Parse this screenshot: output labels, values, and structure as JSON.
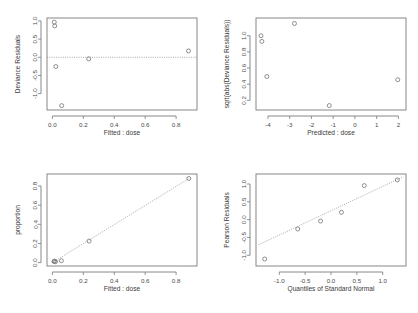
{
  "figure": {
    "title": "",
    "layout": "2x2 grid of regression diagnostic plots",
    "background_color": "#ffffff",
    "point_color": "#6b6b6b",
    "axis_color": "#7a7a7a",
    "reference_line_color": "#9a9a9a",
    "point_symbol": "open-circle"
  },
  "chart_data": [
    {
      "id": "residuals-vs-fitted",
      "position": "top-left",
      "type": "scatter",
      "title": "",
      "xlabel": "Fitted : dose",
      "ylabel": "Deviance Residuals",
      "xlim": [
        -0.035,
        0.935
      ],
      "ylim": [
        -1.45,
        1.08
      ],
      "xticks": [
        0.0,
        0.2,
        0.4,
        0.6,
        0.8
      ],
      "xticklabels": [
        "0.0",
        "0.2",
        "0.4",
        "0.6",
        "0.8"
      ],
      "yticks": [
        -1.0,
        -0.5,
        0.0,
        0.5,
        1.0
      ],
      "yticklabels": [
        "-1.0",
        "-0.5",
        "0.0",
        "0.5",
        "1.0"
      ],
      "grid": false,
      "legend": null,
      "x": [
        0.012,
        0.015,
        0.022,
        0.06,
        0.235,
        0.88
      ],
      "y": [
        0.965,
        0.862,
        -0.255,
        -1.33,
        -0.042,
        0.175
      ],
      "reference_line": {
        "type": "horizontal-dotted",
        "y": 0.0,
        "style": "dotted"
      }
    },
    {
      "id": "scale-location",
      "position": "top-right",
      "type": "scatter",
      "title": "",
      "xlabel": "Predicted : dose",
      "ylabel": "sqrt(abs(Deviance Residuals))",
      "xlim": [
        -4.55,
        2.35
      ],
      "ylim": [
        0.08,
        1.22
      ],
      "xticks": [
        -4,
        -3,
        -2,
        -1,
        0,
        1,
        2
      ],
      "xticklabels": [
        "-4",
        "-3",
        "-2",
        "-1",
        "0",
        "1",
        "2"
      ],
      "yticks": [
        0.2,
        0.4,
        0.6,
        0.8,
        1.0
      ],
      "yticklabels": [
        "0.2",
        "0.4",
        "0.6",
        "0.8",
        "1.0"
      ],
      "grid": false,
      "legend": null,
      "x": [
        -4.32,
        -4.28,
        -4.05,
        -2.78,
        -1.18,
        1.97
      ],
      "y": [
        1.0,
        0.93,
        0.495,
        1.152,
        0.135,
        0.455
      ],
      "reference_line": null
    },
    {
      "id": "observed-vs-fitted",
      "position": "bottom-left",
      "type": "scatter",
      "title": "",
      "xlabel": "Fitted : dose",
      "ylabel": "proportion",
      "xlim": [
        -0.035,
        0.935
      ],
      "ylim": [
        -0.035,
        0.925
      ],
      "xticks": [
        0.0,
        0.2,
        0.4,
        0.6,
        0.8
      ],
      "xticklabels": [
        "0.0",
        "0.2",
        "0.4",
        "0.6",
        "0.8"
      ],
      "yticks": [
        0.0,
        0.2,
        0.4,
        0.6,
        0.8
      ],
      "yticklabels": [
        "0.0",
        "0.2",
        "0.4",
        "0.6",
        "0.8"
      ],
      "grid": false,
      "legend": null,
      "x": [
        0.01,
        0.013,
        0.02,
        0.058,
        0.237,
        0.882
      ],
      "y": [
        0.012,
        0.016,
        0.01,
        0.02,
        0.225,
        0.878
      ],
      "reference_line": {
        "type": "identity-dotted",
        "from": [
          0.0,
          0.0
        ],
        "to": [
          0.89,
          0.885
        ],
        "style": "dotted"
      }
    },
    {
      "id": "normal-qq-pearson",
      "position": "bottom-right",
      "type": "scatter",
      "title": "",
      "xlabel": "Quantiles of Standard Normal",
      "ylabel": "Pearson Residuals",
      "xlim": [
        -1.45,
        1.45
      ],
      "ylim": [
        -1.3,
        1.28
      ],
      "xticks": [
        -1.0,
        -0.5,
        0.0,
        0.5,
        1.0
      ],
      "xticklabels": [
        "-1.0",
        "-0.5",
        "0.0",
        "0.5",
        "1.0"
      ],
      "yticks": [
        -1.0,
        -0.5,
        0.0,
        0.5,
        1.0
      ],
      "yticklabels": [
        "-1.0",
        "-0.5",
        "0.0",
        "0.5",
        "1.0"
      ],
      "grid": false,
      "legend": null,
      "x": [
        -1.282,
        -0.643,
        -0.202,
        0.202,
        0.643,
        1.282
      ],
      "y": [
        -1.105,
        -0.262,
        -0.04,
        0.205,
        0.955,
        1.115
      ],
      "reference_line": {
        "type": "qq-line-dotted",
        "from": [
          -1.4,
          -0.705
        ],
        "to": [
          1.4,
          1.205
        ],
        "style": "dotted"
      }
    }
  ]
}
